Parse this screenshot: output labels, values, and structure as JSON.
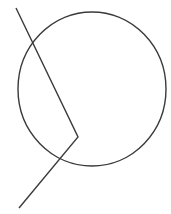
{
  "diagram": {
    "width": 171,
    "height": 214,
    "stroke_color": "#3a3a3a",
    "background": "#ffffff",
    "circle": {
      "cx": 92,
      "cy": 89,
      "rx": 74,
      "ry": 77
    },
    "polyline": {
      "points": [
        [
          16,
          8
        ],
        [
          78,
          137
        ],
        [
          19,
          208
        ]
      ]
    }
  }
}
